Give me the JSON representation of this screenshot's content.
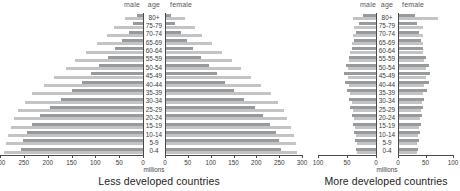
{
  "figure": {
    "columns": {
      "male": "male",
      "age": "age",
      "female": "female"
    },
    "unit_label": "millions"
  },
  "panels": [
    {
      "id": "less-developed",
      "caption": "Less developed countries",
      "unit": "millions",
      "ticks": [
        300,
        250,
        200,
        150,
        100,
        50,
        0
      ],
      "axis_max": 300
    },
    {
      "id": "more-developed",
      "caption": "More developed countries",
      "unit": "millions",
      "ticks": [
        100,
        50,
        0
      ],
      "axis_max": 100
    }
  ],
  "chart_data": [
    {
      "type": "bar",
      "title": "Less developed countries",
      "subtype": "population-pyramid",
      "xlabel": "millions",
      "ylabel": "age",
      "xlim": [
        -300,
        300
      ],
      "grid": false,
      "legend": [
        "series-dark",
        "series-light"
      ],
      "categories": [
        "80+",
        "75-79",
        "70-74",
        "65-69",
        "60-64",
        "55-59",
        "50-54",
        "45-49",
        "40-44",
        "35-39",
        "30-34",
        "25-29",
        "20-24",
        "15-19",
        "10-14",
        "5-9",
        "0-4"
      ],
      "series": [
        {
          "name": "male-dark",
          "side": "left",
          "color": "#999a9c",
          "values": [
            12,
            20,
            30,
            44,
            58,
            74,
            92,
            110,
            128,
            150,
            172,
            196,
            216,
            232,
            244,
            252,
            255
          ]
        },
        {
          "name": "male-light",
          "side": "left",
          "color": "#c3c4c6",
          "values": [
            38,
            60,
            76,
            96,
            120,
            142,
            162,
            186,
            208,
            232,
            248,
            262,
            270,
            278,
            284,
            288,
            292
          ]
        },
        {
          "name": "female-dark",
          "side": "right",
          "color": "#999a9c",
          "values": [
            14,
            22,
            34,
            48,
            62,
            78,
            96,
            114,
            132,
            152,
            174,
            196,
            214,
            230,
            242,
            250,
            254
          ]
        },
        {
          "name": "female-light",
          "side": "right",
          "color": "#c3c4c6",
          "values": [
            44,
            66,
            82,
            102,
            124,
            146,
            166,
            188,
            210,
            232,
            248,
            260,
            268,
            276,
            282,
            286,
            290
          ]
        }
      ]
    },
    {
      "type": "bar",
      "title": "More developed countries",
      "subtype": "population-pyramid",
      "xlabel": "millions",
      "ylabel": "age",
      "xlim": [
        -100,
        100
      ],
      "grid": false,
      "legend": [
        "series-dark",
        "series-light"
      ],
      "categories": [
        "80+",
        "75-79",
        "70-74",
        "65-69",
        "60-64",
        "55-59",
        "50-54",
        "45-49",
        "40-44",
        "35-39",
        "30-34",
        "25-29",
        "20-24",
        "15-19",
        "10-14",
        "5-9",
        "0-4"
      ],
      "series": [
        {
          "name": "male-dark",
          "side": "left",
          "color": "#999a9c",
          "values": [
            22,
            30,
            34,
            38,
            42,
            46,
            52,
            56,
            54,
            50,
            46,
            44,
            42,
            40,
            38,
            36,
            34
          ]
        },
        {
          "name": "male-light",
          "side": "left",
          "color": "#c3c4c6",
          "values": [
            40,
            38,
            40,
            42,
            44,
            46,
            48,
            48,
            46,
            44,
            42,
            40,
            38,
            36,
            34,
            33,
            32
          ]
        },
        {
          "name": "female-dark",
          "side": "right",
          "color": "#999a9c",
          "values": [
            30,
            34,
            38,
            42,
            46,
            50,
            56,
            58,
            56,
            52,
            48,
            46,
            44,
            42,
            40,
            38,
            36
          ]
        },
        {
          "name": "female-light",
          "side": "right",
          "color": "#c3c4c6",
          "values": [
            72,
            46,
            46,
            46,
            46,
            48,
            50,
            50,
            48,
            46,
            44,
            42,
            40,
            38,
            36,
            35,
            34
          ]
        }
      ]
    }
  ]
}
